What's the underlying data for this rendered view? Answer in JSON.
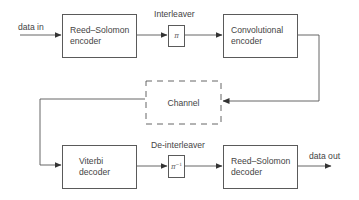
{
  "diagram": {
    "type": "block-diagram",
    "title": "",
    "io": {
      "input_label": "data in",
      "output_label": "data out"
    },
    "blocks": {
      "rs_encoder": {
        "label": "Reed–Solomon\nencoder"
      },
      "interleaver": {
        "caption": "Interleaver",
        "symbol": "π",
        "superscript": ""
      },
      "conv_encoder": {
        "label": "Convolutional\nencoder"
      },
      "channel": {
        "label": "Channel",
        "style": "dashed"
      },
      "viterbi_decoder": {
        "label": "Viterbi\ndecoder"
      },
      "deinterleaver": {
        "caption": "De-interleaver",
        "symbol": "π",
        "superscript": "−1"
      },
      "rs_decoder": {
        "label": "Reed–Solomon\ndecoder"
      }
    },
    "edges": [
      {
        "from": "data in",
        "to": "Reed–Solomon encoder"
      },
      {
        "from": "Reed–Solomon encoder",
        "to": "Interleaver"
      },
      {
        "from": "Interleaver",
        "to": "Convolutional encoder"
      },
      {
        "from": "Convolutional encoder",
        "to": "Channel"
      },
      {
        "from": "Channel",
        "to": "Viterbi decoder"
      },
      {
        "from": "Viterbi decoder",
        "to": "De-interleaver"
      },
      {
        "from": "De-interleaver",
        "to": "Reed–Solomon decoder"
      },
      {
        "from": "Reed–Solomon decoder",
        "to": "data out"
      }
    ],
    "colors": {
      "line": "#4a4a4a",
      "text": "#444444",
      "background": "#ffffff"
    }
  }
}
